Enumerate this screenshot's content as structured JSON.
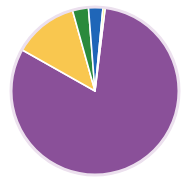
{
  "chart_data": {
    "type": "pie",
    "title": "",
    "subtitle": "",
    "xlabel": "",
    "ylabel": "",
    "grid": false,
    "legend": "none",
    "start_angle_deg": 0,
    "direction": "clockwise",
    "categories": [
      "Purple segment",
      "Amber segment",
      "Green segment",
      "Blue segment",
      "Yellow segment"
    ],
    "values": [
      81.2,
      12.5,
      3.1,
      2.8,
      0.4
    ],
    "value_unit": "percent",
    "colors": [
      "#8a5099",
      "#f9c74f",
      "#2a8a3c",
      "#1f66b8",
      "#f2ec52"
    ],
    "slices": [
      {
        "label": "Purple segment",
        "value": 81.2,
        "color": "#8a5099",
        "start_deg": 7.0,
        "end_deg": 299.4
      },
      {
        "label": "Amber segment",
        "value": 12.5,
        "color": "#f9c74f",
        "start_deg": 299.4,
        "end_deg": 344.4
      },
      {
        "label": "Green segment",
        "value": 3.1,
        "color": "#2a8a3c",
        "start_deg": 344.4,
        "end_deg": 355.5
      },
      {
        "label": "Blue segment",
        "value": 2.8,
        "color": "#1f66b8",
        "start_deg": 355.5,
        "end_deg": 365.5
      },
      {
        "label": "Yellow segment",
        "value": 0.4,
        "color": "#f2ec52",
        "start_deg": 365.5,
        "end_deg": 367.0
      }
    ],
    "geometry": {
      "center_x": 95,
      "center_y": 91,
      "radius": 84,
      "rim_color": "#ece0ee",
      "rim_width": 3,
      "separator_color": "#ffffff",
      "separator_width": 1.6,
      "background": "#ffffff"
    }
  }
}
